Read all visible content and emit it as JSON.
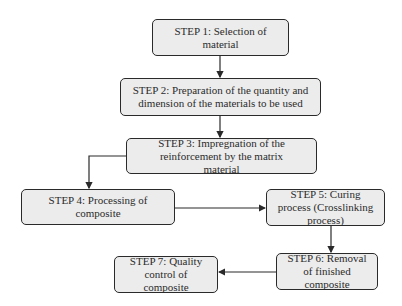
{
  "diagram": {
    "type": "flowchart",
    "steps": [
      {
        "id": 1,
        "label": "STEP 1: Selection of material"
      },
      {
        "id": 2,
        "label": "STEP 2: Preparation of the quantity and dimension of the materials to be used"
      },
      {
        "id": 3,
        "label": "STEP 3: Impregnation of the reinforcement by the matrix material"
      },
      {
        "id": 4,
        "label": "STEP 4: Processing of composite"
      },
      {
        "id": 5,
        "label": "STEP 5: Curing process (Crosslinking process)"
      },
      {
        "id": 6,
        "label": "STEP 6: Removal of finished composite"
      },
      {
        "id": 7,
        "label": "STEP 7: Quality control of composite"
      }
    ],
    "edges": [
      {
        "from": 1,
        "to": 2
      },
      {
        "from": 2,
        "to": 3
      },
      {
        "from": 3,
        "to": 4
      },
      {
        "from": 4,
        "to": 5
      },
      {
        "from": 5,
        "to": 6
      },
      {
        "from": 6,
        "to": 7
      }
    ],
    "colors": {
      "box_fill": "#ececec",
      "box_border": "#2a2a2a",
      "text": "#2b2b2b",
      "arrow": "#2a2a2a"
    }
  }
}
